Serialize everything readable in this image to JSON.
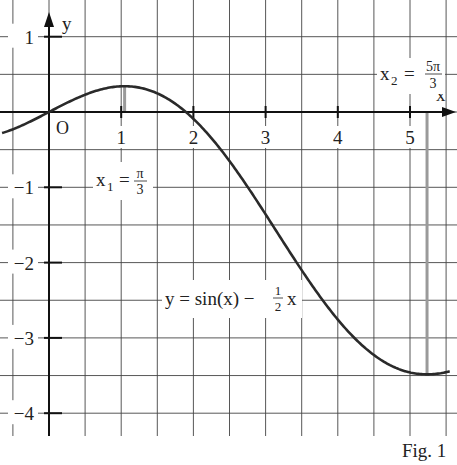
{
  "chart_data": {
    "type": "line",
    "title": "",
    "caption": "Fig. 1",
    "xlabel": "x",
    "ylabel": "y",
    "origin_label": "O",
    "xlim": [
      -0.65,
      5.55
    ],
    "ylim": [
      -4.35,
      1.45
    ],
    "grid": true,
    "grid_step": 0.5,
    "x_ticks": [
      1,
      2,
      3,
      4,
      5
    ],
    "x_tick_labels": [
      "1",
      "2",
      "3",
      "4",
      "5"
    ],
    "y_ticks": [
      1,
      -1,
      -2,
      -3,
      -4
    ],
    "y_tick_labels": [
      "1",
      "−1",
      "−2",
      "−3",
      "−4"
    ],
    "series": [
      {
        "name": "y = sin(x) − ½x",
        "function": "sin(x) - 0.5*x",
        "x_range": [
          -0.65,
          5.55
        ]
      }
    ],
    "annotations": [
      {
        "id": "x1",
        "text_main": "x",
        "text_sub": "1",
        "text_eq": "=",
        "frac_num": "π",
        "frac_den": "3",
        "x_value": 1.0472,
        "note": "local maximum"
      },
      {
        "id": "x2",
        "text_main": "x",
        "text_sub": "2",
        "text_eq": "=",
        "frac_num": "5π",
        "frac_den": "3",
        "x_value": 5.236,
        "note": "local minimum"
      },
      {
        "id": "func",
        "text_lhs": "y = sin(x) −",
        "frac_num": "1",
        "frac_den": "2",
        "text_rhs": "x"
      }
    ]
  }
}
